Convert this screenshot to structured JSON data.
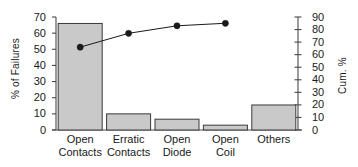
{
  "chart_data": {
    "type": "bar",
    "title": "",
    "subtitle": "",
    "categories": [
      "Open Contacts",
      "Erratic Contacts",
      "Open Diode",
      "Open Coil",
      "Others"
    ],
    "category_lines": [
      [
        "Open",
        "Contacts"
      ],
      [
        "Erratic",
        "Contacts"
      ],
      [
        "Open",
        "Diode"
      ],
      [
        "Open",
        "Coil"
      ],
      [
        "Others",
        ""
      ]
    ],
    "values": [
      66,
      10,
      6.7,
      3,
      15.5
    ],
    "series": [
      {
        "name": "% of Failures",
        "type": "bar",
        "axis": "left",
        "values": [
          66,
          10,
          6.7,
          3,
          15.5
        ]
      },
      {
        "name": "Cum. %",
        "type": "line",
        "axis": "right",
        "values": [
          66,
          77,
          83,
          85,
          null
        ]
      }
    ],
    "xlabel": "",
    "ylabel": "% of Failures",
    "y2label": "Cum. %",
    "ylim": [
      0,
      70
    ],
    "y2lim": [
      0,
      90
    ],
    "yticks": [
      0,
      10,
      20,
      30,
      40,
      50,
      60,
      70
    ],
    "y2ticks": [
      0,
      10,
      20,
      30,
      40,
      50,
      60,
      70,
      80,
      90
    ],
    "ytick_labels": [
      "0",
      "10",
      "20",
      "30",
      "40",
      "50",
      "60",
      "70"
    ],
    "y2tick_labels": [
      "0",
      "10",
      "20",
      "30",
      "40",
      "50",
      "60",
      "70",
      "80",
      "90"
    ],
    "grid": false,
    "legend": "none",
    "bar_fill": "#c9c9c9",
    "bar_stroke": "#3a3a3a",
    "line_color": "#1a1a1a",
    "marker": "filled-circle",
    "axis_color": "#4a4a4a"
  },
  "axes": {
    "left": {
      "title": "% of Failures",
      "ticks": [
        "0",
        "10",
        "20",
        "30",
        "40",
        "50",
        "60",
        "70"
      ]
    },
    "right": {
      "title": "Cum. %",
      "ticks": [
        "0",
        "10",
        "20",
        "30",
        "40",
        "50",
        "60",
        "70",
        "80",
        "90"
      ]
    }
  }
}
